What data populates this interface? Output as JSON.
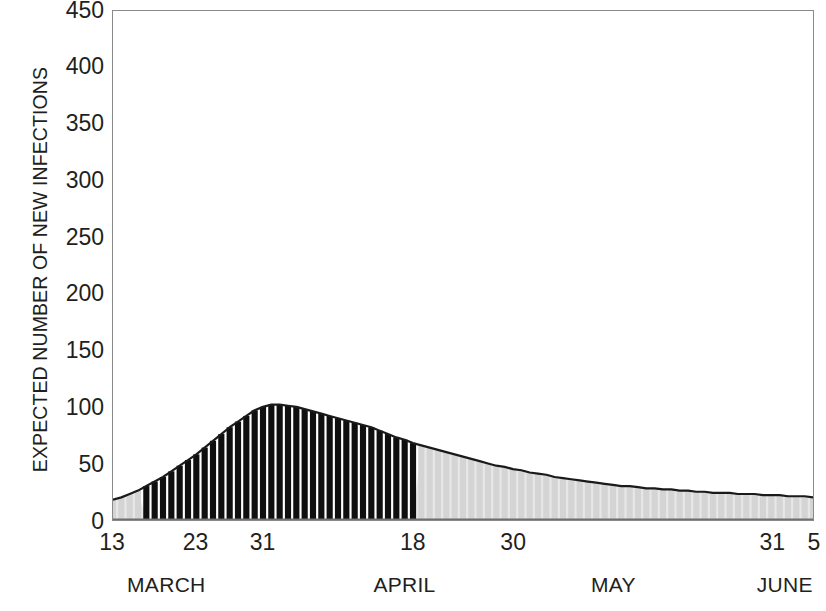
{
  "chart_data": {
    "type": "bar",
    "title": "",
    "subtitle": "",
    "xlabel": "",
    "ylabel": "EXPECTED NUMBER OF NEW INFECTIONS",
    "ylim": [
      0,
      450
    ],
    "ytick_values": [
      0,
      50,
      100,
      150,
      200,
      250,
      300,
      350,
      400,
      450
    ],
    "ytick_labels": [
      "0",
      "50",
      "100",
      "150",
      "200",
      "250",
      "300",
      "350",
      "400",
      "450"
    ],
    "grid": false,
    "legend": null,
    "x_axis_type": "daily-dates",
    "x_start": "March 13",
    "x_end": "June 5",
    "xtick_labels": [
      "13",
      "23",
      "31",
      "18",
      "30",
      "31",
      "5"
    ],
    "xtick_days": [
      0,
      10,
      18,
      36,
      48,
      79,
      84
    ],
    "month_labels": [
      "MARCH",
      "APRIL",
      "MAY",
      "JUNE"
    ],
    "month_day_centers": [
      6.5,
      35,
      60,
      80.5
    ],
    "series": [
      {
        "name": "Expected number of new infections",
        "bar_fill_dark": "#0f0f0f",
        "bar_fill_light": "#d4d4d4",
        "outline_color": "#1a1a1a",
        "dark_range_days": [
          4,
          36
        ],
        "dark_range_label": "16 March to 18 April",
        "categories": [
          "Mar 13",
          "Mar 14",
          "Mar 15",
          "Mar 16",
          "Mar 17",
          "Mar 18",
          "Mar 19",
          "Mar 20",
          "Mar 21",
          "Mar 22",
          "Mar 23",
          "Mar 24",
          "Mar 25",
          "Mar 26",
          "Mar 27",
          "Mar 28",
          "Mar 29",
          "Mar 30",
          "Mar 31",
          "Apr 1",
          "Apr 2",
          "Apr 3",
          "Apr 4",
          "Apr 5",
          "Apr 6",
          "Apr 7",
          "Apr 8",
          "Apr 9",
          "Apr 10",
          "Apr 11",
          "Apr 12",
          "Apr 13",
          "Apr 14",
          "Apr 15",
          "Apr 16",
          "Apr 17",
          "Apr 18",
          "Apr 19",
          "Apr 20",
          "Apr 21",
          "Apr 22",
          "Apr 23",
          "Apr 24",
          "Apr 25",
          "Apr 26",
          "Apr 27",
          "Apr 28",
          "Apr 29",
          "Apr 30",
          "May 1",
          "May 2",
          "May 3",
          "May 4",
          "May 5",
          "May 6",
          "May 7",
          "May 8",
          "May 9",
          "May 10",
          "May 11",
          "May 12",
          "May 13",
          "May 14",
          "May 15",
          "May 16",
          "May 17",
          "May 18",
          "May 19",
          "May 20",
          "May 21",
          "May 22",
          "May 23",
          "May 24",
          "May 25",
          "May 26",
          "May 27",
          "May 28",
          "May 29",
          "May 30",
          "May 31",
          "Jun 1",
          "Jun 2",
          "Jun 3",
          "Jun 4",
          "Jun 5"
        ],
        "values": [
          18,
          20,
          23,
          26,
          30,
          34,
          38,
          43,
          48,
          53,
          58,
          64,
          70,
          76,
          82,
          87,
          92,
          97,
          100,
          102,
          102,
          101,
          100,
          98,
          96,
          94,
          92,
          90,
          88,
          86,
          84,
          82,
          79,
          76,
          73,
          71,
          68,
          66,
          64,
          62,
          60,
          58,
          56,
          54,
          52,
          50,
          48,
          47,
          45,
          44,
          42,
          41,
          40,
          38,
          37,
          36,
          35,
          34,
          33,
          32,
          31,
          30,
          30,
          29,
          28,
          28,
          27,
          27,
          26,
          26,
          25,
          25,
          24,
          24,
          24,
          23,
          23,
          23,
          22,
          22,
          22,
          21,
          21,
          21,
          20
        ]
      }
    ]
  },
  "chart": {
    "frame_color": "#8a8a8a"
  }
}
